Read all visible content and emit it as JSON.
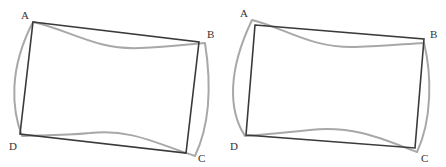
{
  "figures": [
    {
      "id": "left",
      "labels": {
        "A": {
          "text": "A",
          "x": 21,
          "y": 19
        },
        "B": {
          "text": "B",
          "x": 207,
          "y": 38
        },
        "C": {
          "text": "C",
          "x": 198,
          "y": 162
        },
        "D": {
          "text": "D",
          "x": 9,
          "y": 150
        }
      },
      "original_quad": "M33,22 L199,42 L186,153 L20,134 Z",
      "deformed_shape": "M33,22 C70,30 95,50 140,48 C170,47 190,44 205,43 C210,75 212,120 195,156 C160,145 130,128 90,133 C60,136 35,135 22,136 C12,110 8,70 33,22 Z",
      "colors": {
        "original": "#3a3a3a",
        "deformed": "#a8a8a8"
      }
    },
    {
      "id": "right",
      "labels": {
        "A": {
          "text": "A",
          "x": 240,
          "y": 17
        },
        "B": {
          "text": "B",
          "x": 430,
          "y": 38
        },
        "C": {
          "text": "C",
          "x": 421,
          "y": 162
        },
        "D": {
          "text": "D",
          "x": 230,
          "y": 150
        }
      },
      "original_quad": "M255,25 L424,39 L415,148 L246,135 Z",
      "deformed_shape": "M252,20 C285,28 310,48 355,47 C385,46 405,44 424,43 C432,75 432,120 417,152 C385,140 355,125 310,130 C280,133 260,135 245,136 C228,110 228,70 252,20 Z",
      "colors": {
        "original": "#3a3a3a",
        "deformed": "#a8a8a8"
      }
    }
  ]
}
